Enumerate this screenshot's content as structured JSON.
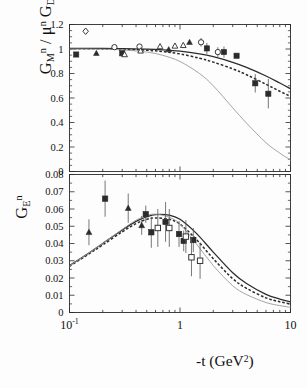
{
  "figure": {
    "xlabel": "-t (GeV2)",
    "xlabel_base": "-t (GeV",
    "xlabel_sup": "2",
    "xlabel_close": ")"
  },
  "panels": {
    "top": {
      "ylabel_parts": {
        "g": "G",
        "sub_m": "M",
        "sup_n1": "n",
        "slash": " / ",
        "mu": "μ",
        "sup_n2": "n",
        "gd": " G",
        "sub_d": "D"
      },
      "ytick_labels": [
        "1.2",
        "1",
        "0.8",
        "0.6",
        "0.4",
        "0.2",
        "0"
      ]
    },
    "bottom": {
      "ylabel_parts": {
        "g": "G",
        "sub_e": "E",
        "sup_n": "n"
      },
      "ytick_labels": [
        "0.08",
        "0.07",
        "0.06",
        "0.05",
        "0.04",
        "0.03",
        "0.02",
        "0.01",
        "0"
      ]
    }
  },
  "xaxis": {
    "tick_labels": [
      {
        "base": "10",
        "sup": "-1"
      },
      {
        "base": "1",
        "sup": ""
      },
      {
        "base": "10",
        "sup": ""
      }
    ]
  },
  "chart_data": [
    {
      "type": "scatter",
      "panel": "top",
      "title": "",
      "xlabel": "-t (GeV^2)",
      "ylabel": "G_M^n / mu^n G_D",
      "xscale": "log",
      "xlim": [
        0.1,
        10
      ],
      "ylim": [
        0,
        1.2
      ],
      "ytick_values": [
        0,
        0.2,
        0.4,
        0.6,
        0.8,
        1.0,
        1.2
      ],
      "grid": false,
      "legend": "none",
      "series": [
        {
          "name": "open-diamond",
          "marker": "open-diamond",
          "points": [
            {
              "x": 0.14,
              "y": 1.145,
              "yerr": 0.0
            }
          ]
        },
        {
          "name": "filled-square",
          "marker": "filled-square",
          "points": [
            {
              "x": 0.115,
              "y": 0.955,
              "yerr": 0.0
            },
            {
              "x": 0.3,
              "y": 0.965,
              "yerr": 0.0
            },
            {
              "x": 1.75,
              "y": 1.005,
              "yerr": 0.045
            },
            {
              "x": 2.5,
              "y": 0.975,
              "yerr": 0.045
            },
            {
              "x": 3.25,
              "y": 0.945,
              "yerr": 0.0
            },
            {
              "x": 4.8,
              "y": 0.72,
              "yerr": 0.075
            },
            {
              "x": 6.3,
              "y": 0.635,
              "yerr": 0.12
            }
          ]
        },
        {
          "name": "filled-triangle",
          "marker": "filled-triangle",
          "points": [
            {
              "x": 0.175,
              "y": 0.965,
              "yerr": 0.0
            },
            {
              "x": 0.79,
              "y": 0.995,
              "yerr": 0.0
            },
            {
              "x": 1.22,
              "y": 1.055,
              "yerr": 0.0
            }
          ]
        },
        {
          "name": "open-circle",
          "marker": "open-circle",
          "points": [
            {
              "x": 0.255,
              "y": 1.015,
              "yerr": 0.0
            },
            {
              "x": 0.43,
              "y": 1.02,
              "yerr": 0.0
            },
            {
              "x": 1.55,
              "y": 1.055,
              "yerr": 0.035
            },
            {
              "x": 2.2,
              "y": 0.975,
              "yerr": 0.04
            }
          ]
        },
        {
          "name": "open-triangle",
          "marker": "open-triangle",
          "points": [
            {
              "x": 0.315,
              "y": 0.955,
              "yerr": 0.0
            },
            {
              "x": 0.44,
              "y": 0.985,
              "yerr": 0.0
            },
            {
              "x": 0.66,
              "y": 1.02,
              "yerr": 0.0
            },
            {
              "x": 0.9,
              "y": 1.025,
              "yerr": 0.0
            },
            {
              "x": 1.07,
              "y": 1.03,
              "yerr": 0.0
            }
          ]
        }
      ],
      "curves": [
        {
          "name": "solid-upper",
          "style": "solid",
          "color": "#2b2b2b",
          "x": [
            0.1,
            0.2,
            0.3,
            0.5,
            0.7,
            1.0,
            1.5,
            2.0,
            3.0,
            4.0,
            6.0,
            8.0,
            10.0
          ],
          "y": [
            1.005,
            1.005,
            1.003,
            0.999,
            0.993,
            0.982,
            0.96,
            0.937,
            0.891,
            0.85,
            0.78,
            0.722,
            0.675
          ]
        },
        {
          "name": "dashed-middle",
          "style": "dashed",
          "color": "#2b2b2b",
          "x": [
            0.1,
            0.2,
            0.3,
            0.5,
            0.7,
            1.0,
            1.5,
            2.0,
            3.0,
            4.0,
            6.0,
            8.0,
            10.0
          ],
          "y": [
            1.002,
            1.001,
            0.998,
            0.99,
            0.979,
            0.96,
            0.925,
            0.893,
            0.838,
            0.79,
            0.712,
            0.655,
            0.613
          ]
        },
        {
          "name": "solid-thin-lower",
          "style": "solid-thin",
          "color": "#9a9a9a",
          "x": [
            0.1,
            0.2,
            0.3,
            0.5,
            0.7,
            1.0,
            1.5,
            2.0,
            3.0,
            4.0,
            6.0,
            8.0,
            10.0
          ],
          "y": [
            1.0,
            0.998,
            0.993,
            0.975,
            0.948,
            0.898,
            0.8,
            0.7,
            0.52,
            0.395,
            0.235,
            0.15,
            0.095
          ]
        }
      ]
    },
    {
      "type": "scatter",
      "panel": "bottom",
      "title": "",
      "xlabel": "-t (GeV^2)",
      "ylabel": "G_E^n",
      "xscale": "log",
      "xlim": [
        0.1,
        10
      ],
      "ylim": [
        0,
        0.08
      ],
      "ytick_values": [
        0,
        0.01,
        0.02,
        0.03,
        0.04,
        0.05,
        0.06,
        0.07,
        0.08
      ],
      "grid": false,
      "legend": "none",
      "series": [
        {
          "name": "filled-triangle",
          "marker": "filled-triangle",
          "points": [
            {
              "x": 0.15,
              "y": 0.0465,
              "yerr": 0.0075
            },
            {
              "x": 0.34,
              "y": 0.0605,
              "yerr": 0.0085
            },
            {
              "x": 0.45,
              "y": 0.0505,
              "yerr": 0.0055
            }
          ]
        },
        {
          "name": "filled-square",
          "marker": "filled-square",
          "points": [
            {
              "x": 0.21,
              "y": 0.066,
              "yerr": 0.0105
            },
            {
              "x": 0.49,
              "y": 0.057,
              "yerr": 0.005
            },
            {
              "x": 0.55,
              "y": 0.0465,
              "yerr": 0.009
            },
            {
              "x": 0.74,
              "y": 0.0525,
              "yerr": 0.0115
            },
            {
              "x": 0.98,
              "y": 0.0455,
              "yerr": 0.0075
            },
            {
              "x": 1.08,
              "y": 0.0415,
              "yerr": 0.006
            },
            {
              "x": 1.32,
              "y": 0.042,
              "yerr": 0.007
            }
          ]
        },
        {
          "name": "open-square",
          "marker": "open-square",
          "points": [
            {
              "x": 0.63,
              "y": 0.049,
              "yerr": 0.011
            },
            {
              "x": 0.8,
              "y": 0.049,
              "yerr": 0.011
            },
            {
              "x": 1.13,
              "y": 0.044,
              "yerr": 0.0095
            },
            {
              "x": 1.27,
              "y": 0.032,
              "yerr": 0.011
            },
            {
              "x": 1.52,
              "y": 0.03,
              "yerr": 0.0105
            }
          ]
        }
      ],
      "curves": [
        {
          "name": "solid-upper",
          "style": "solid",
          "color": "#2b2b2b",
          "x": [
            0.1,
            0.15,
            0.2,
            0.3,
            0.4,
            0.5,
            0.6,
            0.8,
            1.0,
            1.4,
            2.0,
            3.0,
            4.0,
            6.0,
            8.0,
            10.0
          ],
          "y": [
            0.0272,
            0.0345,
            0.04,
            0.0478,
            0.0528,
            0.0555,
            0.0568,
            0.0565,
            0.054,
            0.046,
            0.035,
            0.023,
            0.0168,
            0.0105,
            0.0078,
            0.0062
          ]
        },
        {
          "name": "dashed-middle",
          "style": "dashed",
          "color": "#2b2b2b",
          "x": [
            0.1,
            0.15,
            0.2,
            0.3,
            0.4,
            0.5,
            0.6,
            0.8,
            1.0,
            1.4,
            2.0,
            3.0,
            4.0,
            6.0,
            8.0,
            10.0
          ],
          "y": [
            0.0268,
            0.034,
            0.0392,
            0.0468,
            0.0515,
            0.054,
            0.0548,
            0.054,
            0.0512,
            0.0425,
            0.0312,
            0.0196,
            0.014,
            0.0085,
            0.0062,
            0.005
          ]
        },
        {
          "name": "solid-thin-lower",
          "style": "solid-thin",
          "color": "#9a9a9a",
          "x": [
            0.1,
            0.15,
            0.2,
            0.3,
            0.4,
            0.5,
            0.6,
            0.8,
            1.0,
            1.4,
            2.0,
            3.0,
            4.0,
            6.0,
            8.0,
            10.0
          ],
          "y": [
            0.027,
            0.0345,
            0.04,
            0.0482,
            0.0535,
            0.0562,
            0.057,
            0.0552,
            0.0512,
            0.04,
            0.0272,
            0.0155,
            0.0104,
            0.0058,
            0.004,
            0.003
          ]
        }
      ]
    }
  ]
}
